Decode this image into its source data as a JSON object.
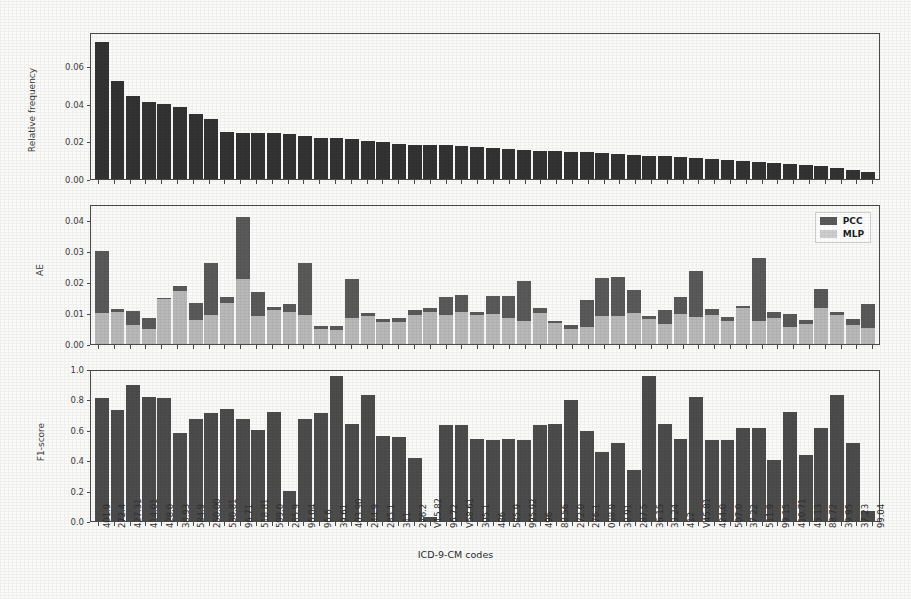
{
  "figure": {
    "xaxis_title": "ICD-9-CM codes",
    "categories": [
      "401.9",
      "272.4",
      "427.31",
      "414.01",
      "428.0",
      "38.93",
      "584.9",
      "250.00",
      "530.81",
      "96.71",
      "518.81",
      "599.0",
      "285.9",
      "96.04",
      "96.6",
      "39.61",
      "403.90",
      "244.9",
      "285.1",
      "311",
      "276.2",
      "V15.82",
      "96.72",
      "V58.61",
      "305.1",
      "486",
      "585.9",
      "995.92",
      "496",
      "88.56",
      "272.0",
      "276.1",
      "038.9",
      "38.91",
      "287.5",
      "36.15",
      "33.24",
      "412",
      "V45.81",
      "424.0",
      "507.0",
      "37.22",
      "511.9",
      "99.15",
      "410.71",
      "45.13",
      "88.72",
      "39.95",
      "37.23",
      "99.04"
    ]
  },
  "legend": {
    "position": "upper-right",
    "entries": [
      {
        "label": "PCC",
        "color": "#5a5a5a"
      },
      {
        "label": "MLP",
        "color": "#b9b9b9"
      }
    ]
  },
  "chart_data": [
    {
      "type": "bar",
      "panel": "top",
      "title": "",
      "xlabel": "",
      "ylabel": "Relative frequency",
      "ylim": [
        0.0,
        0.078
      ],
      "yticks": [
        "0.00",
        "0.02",
        "0.04",
        "0.06"
      ],
      "ytickvalues": [
        0.0,
        0.02,
        0.04,
        0.06
      ],
      "grid": false,
      "categories": [
        "401.9",
        "272.4",
        "427.31",
        "414.01",
        "428.0",
        "38.93",
        "584.9",
        "250.00",
        "530.81",
        "96.71",
        "518.81",
        "599.0",
        "285.9",
        "96.04",
        "96.6",
        "39.61",
        "403.90",
        "244.9",
        "285.1",
        "311",
        "276.2",
        "V15.82",
        "96.72",
        "V58.61",
        "305.1",
        "486",
        "585.9",
        "995.92",
        "496",
        "88.56",
        "272.0",
        "276.1",
        "038.9",
        "38.91",
        "287.5",
        "36.15",
        "33.24",
        "412",
        "V45.81",
        "424.0",
        "507.0",
        "37.22",
        "511.9",
        "99.15",
        "410.71",
        "45.13",
        "88.72",
        "39.95",
        "37.23",
        "99.04"
      ],
      "values": [
        0.0735,
        0.0525,
        0.0448,
        0.0415,
        0.0405,
        0.0385,
        0.035,
        0.0325,
        0.0252,
        0.0248,
        0.0246,
        0.0246,
        0.0243,
        0.023,
        0.0222,
        0.0219,
        0.0213,
        0.0203,
        0.0199,
        0.0191,
        0.0184,
        0.0182,
        0.0181,
        0.0178,
        0.0172,
        0.0168,
        0.016,
        0.0156,
        0.0153,
        0.0149,
        0.0146,
        0.0143,
        0.0139,
        0.0135,
        0.0131,
        0.0126,
        0.0122,
        0.0118,
        0.0113,
        0.0108,
        0.0103,
        0.0098,
        0.0093,
        0.0087,
        0.0081,
        0.0074,
        0.0068,
        0.0058,
        0.005,
        0.004
      ]
    },
    {
      "type": "bar",
      "panel": "middle",
      "title": "",
      "xlabel": "",
      "ylabel": "AE",
      "ylim": [
        0.0,
        0.045
      ],
      "yticks": [
        "0.00",
        "0.01",
        "0.02",
        "0.03",
        "0.04"
      ],
      "ytickvalues": [
        0.0,
        0.01,
        0.02,
        0.03,
        0.04
      ],
      "grid": false,
      "categories": [
        "401.9",
        "272.4",
        "427.31",
        "414.01",
        "428.0",
        "38.93",
        "584.9",
        "250.00",
        "530.81",
        "96.71",
        "518.81",
        "599.0",
        "285.9",
        "96.04",
        "96.6",
        "39.61",
        "403.90",
        "244.9",
        "285.1",
        "311",
        "276.2",
        "V15.82",
        "96.72",
        "V58.61",
        "305.1",
        "486",
        "585.9",
        "995.92",
        "496",
        "88.56",
        "272.0",
        "276.1",
        "038.9",
        "38.91",
        "287.5",
        "36.15",
        "33.24",
        "412",
        "V45.81",
        "424.0",
        "507.0",
        "37.22",
        "511.9",
        "99.15",
        "410.71",
        "45.13",
        "88.72",
        "39.95",
        "37.23",
        "99.04"
      ],
      "series": [
        {
          "name": "PCC",
          "color": "#5a5a5a",
          "values": [
            0.0302,
            0.0114,
            0.0108,
            0.0085,
            0.0151,
            0.0189,
            0.0133,
            0.0265,
            0.0154,
            0.0415,
            0.0171,
            0.012,
            0.0132,
            0.0265,
            0.0059,
            0.006,
            0.0213,
            0.0101,
            0.0082,
            0.0085,
            0.0112,
            0.0118,
            0.0154,
            0.016,
            0.0103,
            0.0155,
            0.0158,
            0.0207,
            0.0119,
            0.0076,
            0.0063,
            0.0145,
            0.0215,
            0.0217,
            0.0175,
            0.0091,
            0.0112,
            0.0152,
            0.0237,
            0.0113,
            0.0088,
            0.0125,
            0.0281,
            0.0105,
            0.0098,
            0.0077,
            0.0178,
            0.0106,
            0.008,
            0.013
          ]
        },
        {
          "name": "MLP",
          "color": "#b9b9b9",
          "values": [
            0.0102,
            0.0105,
            0.0062,
            0.005,
            0.0148,
            0.0172,
            0.0078,
            0.0095,
            0.0135,
            0.0213,
            0.009,
            0.0111,
            0.0104,
            0.0096,
            0.005,
            0.0047,
            0.0085,
            0.0092,
            0.0071,
            0.0073,
            0.0095,
            0.0103,
            0.0096,
            0.0104,
            0.0095,
            0.0099,
            0.0084,
            0.0075,
            0.0102,
            0.0068,
            0.005,
            0.0057,
            0.009,
            0.0091,
            0.01,
            0.0081,
            0.0066,
            0.0098,
            0.0089,
            0.0093,
            0.0075,
            0.0116,
            0.0074,
            0.0084,
            0.0057,
            0.0066,
            0.0118,
            0.0096,
            0.0062,
            0.0051
          ]
        }
      ]
    },
    {
      "type": "bar",
      "panel": "bottom",
      "title": "",
      "xlabel": "ICD-9-CM codes",
      "ylabel": "F1-score",
      "ylim": [
        0.0,
        1.0
      ],
      "yticks": [
        "0.0",
        "0.2",
        "0.4",
        "0.6",
        "0.8",
        "1.0"
      ],
      "ytickvalues": [
        0.0,
        0.2,
        0.4,
        0.6,
        0.8,
        1.0
      ],
      "grid": false,
      "categories": [
        "401.9",
        "272.4",
        "427.31",
        "414.01",
        "428.0",
        "38.93",
        "584.9",
        "250.00",
        "530.81",
        "96.71",
        "518.81",
        "599.0",
        "285.9",
        "96.04",
        "96.6",
        "39.61",
        "403.90",
        "244.9",
        "285.1",
        "311",
        "276.2",
        "V15.82",
        "96.72",
        "V58.61",
        "305.1",
        "486",
        "585.9",
        "995.92",
        "496",
        "88.56",
        "272.0",
        "276.1",
        "038.9",
        "38.91",
        "287.5",
        "36.15",
        "33.24",
        "412",
        "V45.81",
        "424.0",
        "507.0",
        "37.22",
        "511.9",
        "99.15",
        "410.71",
        "45.13",
        "88.72",
        "39.95",
        "37.23",
        "99.04"
      ],
      "values": [
        0.82,
        0.74,
        0.91,
        0.83,
        0.82,
        0.59,
        0.68,
        0.72,
        0.75,
        0.68,
        0.61,
        0.73,
        0.2,
        0.68,
        0.72,
        0.97,
        0.65,
        0.84,
        0.57,
        0.56,
        0.42,
        0.03,
        0.64,
        0.64,
        0.55,
        0.54,
        0.55,
        0.54,
        0.64,
        0.65,
        0.81,
        0.6,
        0.46,
        0.52,
        0.34,
        0.97,
        0.65,
        0.55,
        0.83,
        0.54,
        0.54,
        0.62,
        0.62,
        0.41,
        0.73,
        0.44,
        0.62,
        0.84,
        0.52,
        0.07
      ]
    }
  ]
}
